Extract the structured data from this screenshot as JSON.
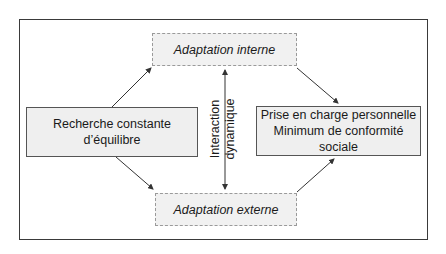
{
  "diagram": {
    "top_box": {
      "label": "Adaptation interne"
    },
    "bottom_box": {
      "label": "Adaptation externe"
    },
    "left_box": {
      "label": "Recherche constante d’équilibre"
    },
    "right_box": {
      "line1": "Prise en charge personnelle",
      "line2": "Minimum de conformité sociale"
    },
    "center_label": {
      "line1": "Interaction",
      "line2": "dynamique"
    },
    "colors": {
      "box_fill": "#efefef",
      "border": "#3a3a3a",
      "arrow": "#333333"
    }
  }
}
